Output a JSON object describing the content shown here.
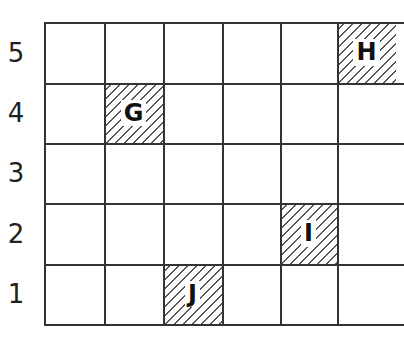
{
  "grid": {
    "rows": 5,
    "columns_visible": 6,
    "row_labels": [
      "5",
      "4",
      "3",
      "2",
      "1"
    ],
    "shaded_cells": [
      {
        "label": "G",
        "col": 2,
        "row": 4
      },
      {
        "label": "H",
        "col": 6,
        "row": 5
      },
      {
        "label": "I",
        "col": 5,
        "row": 2
      },
      {
        "label": "J",
        "col": 3,
        "row": 1
      }
    ],
    "line_color": "#333333",
    "hatch_color": "#555555"
  }
}
